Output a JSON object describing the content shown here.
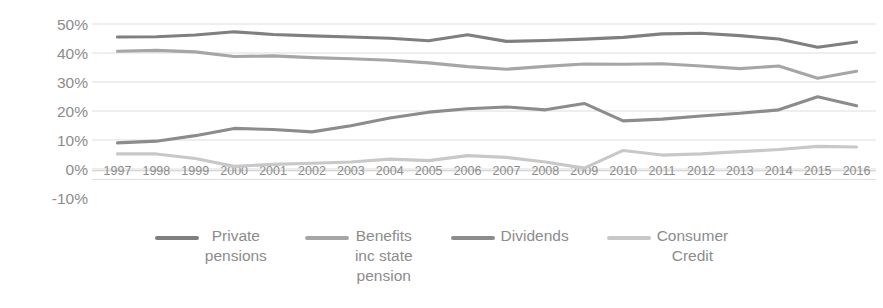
{
  "chart_data": {
    "type": "line",
    "title": "",
    "subtitle": "",
    "xlabel": "",
    "ylabel": "",
    "grid": true,
    "legend_position": "bottom",
    "x": [
      "1997",
      "1998",
      "1999",
      "2000",
      "2001",
      "2002",
      "2003",
      "2004",
      "2005",
      "2006",
      "2007",
      "2008",
      "2009",
      "2010",
      "2011",
      "2012",
      "2013",
      "2014",
      "2015",
      "2016"
    ],
    "categories": [
      "1997",
      "1998",
      "1999",
      "2000",
      "2001",
      "2002",
      "2003",
      "2004",
      "2005",
      "2006",
      "2007",
      "2008",
      "2009",
      "2010",
      "2011",
      "2012",
      "2013",
      "2014",
      "2015",
      "2016"
    ],
    "xtick_labels": [
      "1997",
      "1998",
      "1999",
      "2000",
      "2001",
      "2002",
      "2003",
      "2004",
      "2005",
      "2006",
      "2007",
      "2008",
      "2009",
      "2010",
      "2011",
      "2012",
      "2013",
      "2014",
      "2015",
      "2016"
    ],
    "ytick_labels": [
      "50%",
      "40%",
      "30%",
      "20%",
      "10%",
      "0%",
      "-10%"
    ],
    "ytick_values": [
      50,
      40,
      30,
      20,
      10,
      0,
      -10
    ],
    "ylim": [
      -10,
      55
    ],
    "yunit": "%",
    "series": [
      {
        "name": "Private pensions",
        "legend_label": "Private\npensions",
        "color": "#7f7f7f",
        "values": [
          45.5,
          45.6,
          46.2,
          47.3,
          46.4,
          45.9,
          45.5,
          45.1,
          44.2,
          46.3,
          44.0,
          44.3,
          44.8,
          45.4,
          46.6,
          46.8,
          46.0,
          44.8,
          42.0,
          43.8
        ]
      },
      {
        "name": "Benefits inc state pension",
        "legend_label": "Benefits\ninc state\npension",
        "color": "#a6a6a6",
        "values": [
          40.6,
          40.9,
          40.4,
          38.8,
          39.0,
          38.4,
          38.0,
          37.5,
          36.6,
          35.3,
          34.4,
          35.4,
          36.2,
          36.1,
          36.3,
          35.5,
          34.6,
          35.5,
          31.3,
          33.7
        ]
      },
      {
        "name": "Dividends",
        "legend_label": "Dividends",
        "color": "#8c8c8c",
        "values": [
          9.0,
          9.6,
          11.5,
          14.0,
          13.6,
          12.8,
          14.9,
          17.6,
          19.6,
          20.8,
          21.4,
          20.4,
          22.6,
          16.6,
          17.2,
          18.3,
          19.2,
          20.4,
          24.9,
          21.8
        ]
      },
      {
        "name": "Consumer Credit",
        "legend_label": "Consumer\nCredit",
        "color": "#c8c8c8",
        "values": [
          5.2,
          5.2,
          3.6,
          0.9,
          1.6,
          2.0,
          2.4,
          3.4,
          2.9,
          4.6,
          4.0,
          2.4,
          0.3,
          6.4,
          4.8,
          5.2,
          6.0,
          6.7,
          7.8,
          7.6
        ]
      }
    ]
  },
  "legend": {
    "items": [
      {
        "label": "Private\npensions",
        "color": "#7f7f7f",
        "name": "private-pensions"
      },
      {
        "label": "Benefits\ninc state\npension",
        "color": "#a6a6a6",
        "name": "benefits-inc-state-pension"
      },
      {
        "label": "Dividends",
        "color": "#8c8c8c",
        "name": "dividends"
      },
      {
        "label": "Consumer\nCredit",
        "color": "#c8c8c8",
        "name": "consumer-credit"
      }
    ]
  }
}
